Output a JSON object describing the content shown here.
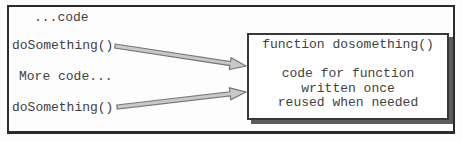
{
  "diagram": {
    "code_column": {
      "lines": [
        "...code",
        "doSomething()",
        "More code...",
        "doSomething()"
      ]
    },
    "function_box": {
      "title": "function dosomething()",
      "lines": [
        "code for function",
        "written once",
        "reused when needed"
      ]
    },
    "arrows": [
      {
        "name": "first-call-arrow",
        "from": "doSomething() first call",
        "to": "function box"
      },
      {
        "name": "second-call-arrow",
        "from": "doSomething() second call",
        "to": "function box"
      }
    ],
    "colors": {
      "background": "#ffffff",
      "frame_border": "#2c2c2c",
      "box_border": "#383838",
      "box_shadow": "#5c5c5c",
      "arrow_fill": "#c8c8c8",
      "arrow_outline": "#787878",
      "text": "#414141"
    }
  }
}
